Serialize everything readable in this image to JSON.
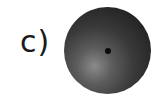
{
  "figure": {
    "label": "c)",
    "shape": "sphere-with-center-point",
    "colors": {
      "sphere_dark": "#1c1c1c",
      "sphere_light": "#8a8a8a",
      "dot": "#0a0a0a",
      "label": "#1a1a1a"
    }
  }
}
